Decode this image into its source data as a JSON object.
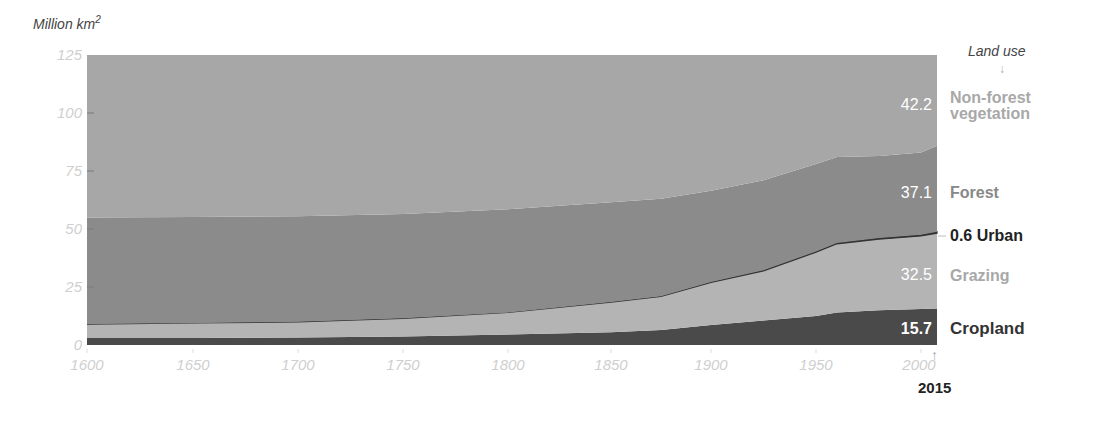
{
  "chart_data": {
    "type": "area",
    "stacked": true,
    "title": "",
    "ylabel": "Million km²",
    "xlabel": "",
    "ylim": [
      0,
      125
    ],
    "xlim": [
      1600,
      2015
    ],
    "yticks": [
      0,
      25,
      50,
      75,
      100,
      125
    ],
    "xticks": [
      1600,
      1650,
      1700,
      1750,
      1800,
      1850,
      1900,
      1950,
      2000
    ],
    "legend_title": "Land use",
    "end_year_label": "2015",
    "x": [
      1600,
      1650,
      1700,
      1750,
      1800,
      1850,
      1875,
      1900,
      1925,
      1950,
      1960,
      1980,
      2000,
      2015
    ],
    "series": [
      {
        "name": "Cropland",
        "color": "#4a4a4a",
        "end_value": "15.7",
        "values": [
          3.0,
          3.0,
          3.2,
          3.6,
          4.5,
          5.5,
          6.5,
          8.6,
          10.5,
          12.5,
          14.0,
          15.0,
          15.5,
          15.7
        ]
      },
      {
        "name": "Grazing",
        "color": "#b4b4b4",
        "end_value": "32.5",
        "values": [
          6.0,
          6.5,
          6.8,
          7.9,
          9.5,
          13.0,
          14.5,
          18.4,
          21.5,
          27.5,
          29.6,
          30.6,
          31.5,
          32.5
        ]
      },
      {
        "name": "Urban",
        "color": "#333333",
        "end_value": "0.6",
        "values": [
          0.0,
          0.0,
          0.0,
          0.0,
          0.0,
          0.0,
          0.0,
          0.1,
          0.2,
          0.3,
          0.4,
          0.5,
          0.5,
          0.6
        ]
      },
      {
        "name": "Forest",
        "color": "#8b8b8b",
        "end_value": "37.1",
        "values": [
          46.0,
          45.7,
          45.5,
          45.0,
          44.5,
          43.0,
          42.0,
          39.4,
          38.8,
          37.7,
          37.0,
          35.4,
          35.5,
          37.1
        ]
      },
      {
        "name": "Non-forest vegetation",
        "color": "#a7a7a7",
        "end_value": "42.2",
        "values": [
          70.0,
          69.8,
          69.5,
          68.5,
          66.5,
          63.5,
          62.0,
          58.5,
          54.0,
          47.0,
          44.0,
          43.5,
          42.0,
          39.1
        ]
      }
    ]
  },
  "labels": {
    "y_unit": "Million km",
    "y_unit_sup": "2",
    "legend_title": "Land use",
    "legend_arrow": "↓",
    "nonforest_value": "42.2",
    "nonforest_line1": "Non-forest",
    "nonforest_line2": "vegetation",
    "forest_value": "37.1",
    "forest_label": "Forest",
    "urban_value": "0.6",
    "urban_label": "Urban",
    "grazing_value": "32.5",
    "grazing_label": "Grazing",
    "cropland_value": "15.7",
    "cropland_label": "Cropland",
    "end_year": "2015",
    "end_arrow": "↑"
  }
}
